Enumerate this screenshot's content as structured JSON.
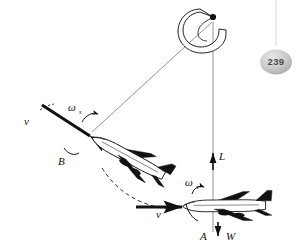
{
  "page": {
    "background_color": "#ffffff",
    "ink_color": "#111111",
    "thin_line_color": "#555555",
    "page_number": "239",
    "badge_color": "#c9c9c9",
    "badge_text_color": "#4a4a4a"
  },
  "diagram": {
    "type": "aircraft-loop-maneuver-free-body-diagram",
    "pivot": {
      "name": "rotation-center",
      "x": 213,
      "y": 17,
      "rotation_arrow": "counterclockwise-curved-arrow"
    },
    "radius_lines": [
      {
        "name": "radius-to-position-B",
        "x1": 213,
        "y1": 20,
        "x2": 93,
        "y2": 131
      },
      {
        "name": "radius-to-position-A",
        "x1": 213,
        "y1": 20,
        "x2": 213,
        "y2": 232
      }
    ],
    "aircraft": [
      {
        "id": "aircraft-B",
        "label": "B",
        "label_x": 60,
        "label_y": 162,
        "position": {
          "x": 110,
          "y": 145
        },
        "rotation_deg": 28,
        "velocity_label": "v",
        "velocity_label_x": 26,
        "velocity_label_y": 122,
        "omega_label": "ω",
        "omega_subscript": "s",
        "omega_label_x": 70,
        "omega_label_y": 110
      },
      {
        "id": "aircraft-A",
        "label": "A",
        "label_x": 202,
        "label_y": 237,
        "position": {
          "x": 228,
          "y": 203
        },
        "rotation_deg": 0,
        "velocity_label": "v",
        "velocity_label_x": 158,
        "velocity_label_y": 215,
        "omega_label": "ω",
        "omega_subscript": "s",
        "omega_label_x": 188,
        "omega_label_y": 185
      }
    ],
    "force_vectors": [
      {
        "name": "lift-vector",
        "label": "L",
        "label_x": 220,
        "label_y": 160,
        "direction": "up"
      },
      {
        "name": "weight-vector",
        "label": "W",
        "label_x": 228,
        "label_y": 237,
        "direction": "down"
      }
    ],
    "trajectory": {
      "name": "dashed-flight-path",
      "style": "dashed-arc"
    }
  }
}
